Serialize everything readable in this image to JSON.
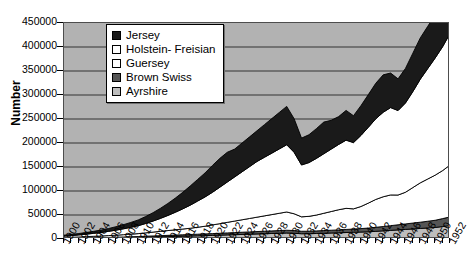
{
  "axes": {
    "ylabel": "Number",
    "yticks": [
      "450000",
      "400000",
      "350000",
      "300000",
      "250000",
      "200000",
      "150000",
      "100000",
      "50000",
      "0"
    ],
    "xticks": [
      "1900",
      "1902",
      "1904",
      "1906",
      "1908",
      "1910",
      "1912",
      "1914",
      "1916",
      "1918",
      "1920",
      "1922",
      "1924",
      "1926",
      "1928",
      "1930",
      "1932",
      "1934",
      "1936",
      "1938",
      "1940",
      "1942",
      "1944",
      "1946",
      "1948",
      "1950",
      "1952"
    ]
  },
  "legend": {
    "items": [
      {
        "label": "Jersey",
        "color": "#1a1a1a"
      },
      {
        "label": "Holstein- Freisian",
        "color": "#ffffff"
      },
      {
        "label": "Guersey",
        "color": "#ffffff"
      },
      {
        "label": "Brown Swiss",
        "color": "#555555"
      },
      {
        "label": "Ayrshire",
        "color": "#bdbdbd"
      }
    ]
  },
  "colors": {
    "plot_background": "#b2b2b2",
    "gridline": "#333333",
    "axis": "#000000",
    "jersey": "#1a1a1a",
    "holstein": "#ffffff",
    "guersey": "#ffffff",
    "brown_swiss": "#555555",
    "ayrshire": "#bdbdbd"
  },
  "chart_data": {
    "type": "area",
    "title": "",
    "xlabel": "",
    "ylabel": "Number",
    "ylim": [
      0,
      450000
    ],
    "xlim": [
      1900,
      1952
    ],
    "grid": true,
    "legend_position": "upper-left-inside",
    "stacked": true,
    "stack_order_bottom_to_top": [
      "Ayrshire",
      "Brown Swiss",
      "Guersey",
      "Holstein- Freisian",
      "Jersey"
    ],
    "x": [
      1900,
      1901,
      1902,
      1903,
      1904,
      1905,
      1906,
      1907,
      1908,
      1909,
      1910,
      1911,
      1912,
      1913,
      1914,
      1915,
      1916,
      1917,
      1918,
      1919,
      1920,
      1921,
      1922,
      1923,
      1924,
      1925,
      1926,
      1927,
      1928,
      1929,
      1930,
      1931,
      1932,
      1933,
      1934,
      1935,
      1936,
      1937,
      1938,
      1939,
      1940,
      1941,
      1942,
      1943,
      1944,
      1945,
      1946,
      1947,
      1948,
      1949,
      1950,
      1951,
      1952
    ],
    "series": [
      {
        "name": "Ayrshire",
        "values": [
          1000,
          1200,
          1400,
          1600,
          1800,
          2000,
          2200,
          2500,
          2800,
          3100,
          3400,
          3800,
          4200,
          4600,
          5000,
          5400,
          5800,
          6200,
          6600,
          7000,
          7500,
          8000,
          8500,
          9000,
          9500,
          10000,
          10500,
          11000,
          11500,
          12000,
          12500,
          12000,
          11000,
          11000,
          11500,
          12000,
          12500,
          13000,
          13500,
          14000,
          14500,
          15000,
          16000,
          17000,
          18000,
          19000,
          20000,
          21000,
          22000,
          23000,
          24000,
          26000,
          28000
        ]
      },
      {
        "name": "Brown Swiss",
        "values": [
          500,
          600,
          700,
          800,
          900,
          1000,
          1100,
          1200,
          1400,
          1600,
          1800,
          2000,
          2200,
          2400,
          2600,
          2800,
          3000,
          3200,
          3400,
          3600,
          3800,
          4000,
          4200,
          4400,
          4600,
          4800,
          5000,
          5200,
          5400,
          5600,
          5800,
          5600,
          5200,
          5200,
          5400,
          5600,
          5800,
          6000,
          6400,
          6800,
          7200,
          7800,
          8400,
          9000,
          9800,
          10600,
          11400,
          12200,
          13000,
          14000,
          15000,
          16500,
          18000
        ]
      },
      {
        "name": "Guersey",
        "values": [
          1500,
          1800,
          2100,
          2500,
          2900,
          3300,
          3800,
          4300,
          4800,
          5400,
          6000,
          7000,
          8000,
          9000,
          10000,
          11000,
          12000,
          13000,
          14500,
          16000,
          18000,
          20000,
          22000,
          24000,
          26000,
          28000,
          30000,
          32000,
          34000,
          36000,
          38000,
          35000,
          30000,
          31000,
          33000,
          36000,
          39000,
          42000,
          44000,
          42000,
          46000,
          52000,
          58000,
          62000,
          64000,
          62000,
          66000,
          74000,
          82000,
          88000,
          94000,
          100000,
          108000
        ]
      },
      {
        "name": "Holstein- Freisian",
        "values": [
          3000,
          3600,
          4300,
          5200,
          6200,
          7400,
          8800,
          10400,
          12200,
          14200,
          16500,
          19500,
          23000,
          27000,
          31500,
          36500,
          42000,
          48000,
          54500,
          61000,
          68000,
          76000,
          84000,
          92000,
          100000,
          108000,
          116000,
          122000,
          128000,
          134000,
          140000,
          128000,
          108000,
          112000,
          118000,
          124000,
          130000,
          136000,
          142000,
          138000,
          148000,
          158000,
          168000,
          176000,
          182000,
          176000,
          186000,
          200000,
          216000,
          230000,
          244000,
          258000,
          274000
        ]
      },
      {
        "name": "Jersey",
        "values": [
          2000,
          2400,
          2900,
          3500,
          4200,
          5000,
          6000,
          7200,
          8600,
          10200,
          12000,
          14500,
          17500,
          21000,
          25000,
          29500,
          34500,
          40000,
          45000,
          50000,
          56000,
          60000,
          62000,
          58000,
          60000,
          62000,
          64000,
          68000,
          72000,
          76000,
          80000,
          70000,
          56000,
          58000,
          62000,
          66000,
          60000,
          58000,
          62000,
          56000,
          62000,
          68000,
          74000,
          78000,
          72000,
          66000,
          72000,
          80000,
          86000,
          88000,
          90000,
          94000,
          98000
        ]
      }
    ]
  }
}
